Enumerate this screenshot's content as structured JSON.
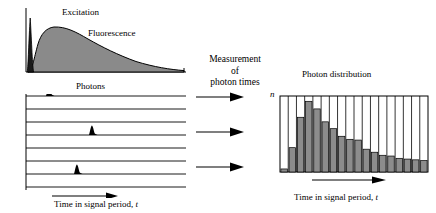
{
  "left_panel": {
    "excitation_label": "Excitation",
    "fluorescence_label": "Fluorescence",
    "photons_label": "Photons",
    "axis_label_prefix": "Time in signal period, ",
    "axis_label_var": "t",
    "trace_count": 8,
    "photon_events": [
      {
        "trace_index": 0,
        "t": 0.13
      },
      {
        "trace_index": 3,
        "t": 0.4
      },
      {
        "trace_index": 6,
        "t": 0.31
      }
    ]
  },
  "middle": {
    "line1": "Measurement",
    "line2": "of",
    "line3": "photon times",
    "arrow_count": 3
  },
  "right_panel": {
    "title": "Photon distribution",
    "y_axis_label": "n",
    "axis_label_prefix": "Time in signal period, ",
    "axis_label_var": "t"
  },
  "colors": {
    "ink": "#000000",
    "fill_gray": "#8a8a8a",
    "bar_gray": "#8c8c8c",
    "excitation_dark": "#1a1a1a",
    "background": "#ffffff"
  },
  "chart_data": [
    {
      "type": "area",
      "title": "Excitation and fluorescence decay",
      "xlabel": "Time in signal period, t",
      "ylabel": "",
      "xlim": [
        0,
        1
      ],
      "ylim": [
        0,
        1
      ],
      "grid": false,
      "series": [
        {
          "name": "Excitation",
          "color": "#1a1a1a",
          "x": [
            0.0,
            0.012,
            0.022,
            0.03,
            0.038,
            0.046,
            0.056,
            0.07,
            0.09,
            0.12
          ],
          "values": [
            0.0,
            0.22,
            0.62,
            0.93,
            1.0,
            0.78,
            0.42,
            0.14,
            0.03,
            0.0
          ]
        },
        {
          "name": "Fluorescence",
          "color": "#8a8a8a",
          "x": [
            0.03,
            0.05,
            0.075,
            0.1,
            0.13,
            0.17,
            0.22,
            0.28,
            0.35,
            0.43,
            0.52,
            0.62,
            0.72,
            0.82,
            0.9,
            0.96,
            1.0
          ],
          "values": [
            0.0,
            0.48,
            0.76,
            0.84,
            0.85,
            0.8,
            0.72,
            0.63,
            0.54,
            0.45,
            0.37,
            0.29,
            0.22,
            0.16,
            0.12,
            0.09,
            0.07
          ]
        }
      ]
    },
    {
      "type": "bar",
      "title": "Photon distribution",
      "xlabel": "Time in signal period, t",
      "ylabel": "n",
      "bin_count": 18,
      "ylim": [
        0,
        1
      ],
      "grid": false,
      "categories": [
        "1",
        "2",
        "3",
        "4",
        "5",
        "6",
        "7",
        "8",
        "9",
        "10",
        "11",
        "12",
        "13",
        "14",
        "15",
        "16",
        "17",
        "18"
      ],
      "values": [
        0.04,
        0.32,
        0.72,
        0.93,
        0.83,
        0.66,
        0.57,
        0.47,
        0.43,
        0.42,
        0.3,
        0.26,
        0.22,
        0.21,
        0.18,
        0.17,
        0.16,
        0.15
      ]
    }
  ]
}
